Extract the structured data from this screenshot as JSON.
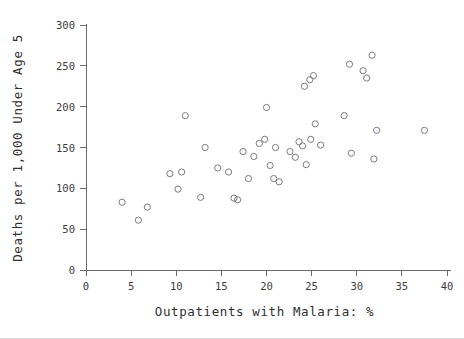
{
  "chart_data": {
    "type": "scatter",
    "title": "",
    "xlabel": "Outpatients with Malaria: %",
    "ylabel": "Deaths per 1,000 Under Age 5",
    "xlim": [
      0,
      40
    ],
    "ylim": [
      0,
      300
    ],
    "xticks": [
      0,
      5,
      10,
      15,
      20,
      25,
      30,
      35,
      40
    ],
    "yticks": [
      0,
      50,
      100,
      150,
      200,
      250,
      300
    ],
    "xtick_labels": [
      "0",
      "5",
      "10",
      "15",
      "20",
      "25",
      "30",
      "35",
      "40"
    ],
    "ytick_labels": [
      "0",
      "50",
      "100",
      "150",
      "200",
      "250",
      "300"
    ],
    "grid": false,
    "legend": false,
    "marker": "open-circle",
    "marker_color": "#7b7b88",
    "points": [
      {
        "x": 4.0,
        "y": 83
      },
      {
        "x": 5.8,
        "y": 61
      },
      {
        "x": 6.8,
        "y": 77
      },
      {
        "x": 9.3,
        "y": 118
      },
      {
        "x": 10.2,
        "y": 99
      },
      {
        "x": 10.6,
        "y": 120
      },
      {
        "x": 11.0,
        "y": 189
      },
      {
        "x": 12.7,
        "y": 89
      },
      {
        "x": 13.2,
        "y": 150
      },
      {
        "x": 14.6,
        "y": 125
      },
      {
        "x": 15.8,
        "y": 120
      },
      {
        "x": 16.4,
        "y": 88
      },
      {
        "x": 16.8,
        "y": 86
      },
      {
        "x": 17.4,
        "y": 145
      },
      {
        "x": 18.0,
        "y": 112
      },
      {
        "x": 18.6,
        "y": 139
      },
      {
        "x": 19.2,
        "y": 155
      },
      {
        "x": 19.8,
        "y": 160
      },
      {
        "x": 20.0,
        "y": 199
      },
      {
        "x": 20.4,
        "y": 128
      },
      {
        "x": 20.8,
        "y": 112
      },
      {
        "x": 21.0,
        "y": 150
      },
      {
        "x": 21.4,
        "y": 108
      },
      {
        "x": 22.6,
        "y": 145
      },
      {
        "x": 23.2,
        "y": 138
      },
      {
        "x": 23.6,
        "y": 157
      },
      {
        "x": 24.0,
        "y": 152
      },
      {
        "x": 24.2,
        "y": 225
      },
      {
        "x": 24.4,
        "y": 129
      },
      {
        "x": 24.8,
        "y": 233
      },
      {
        "x": 24.9,
        "y": 160
      },
      {
        "x": 25.2,
        "y": 238
      },
      {
        "x": 25.4,
        "y": 179
      },
      {
        "x": 26.0,
        "y": 153
      },
      {
        "x": 28.6,
        "y": 189
      },
      {
        "x": 29.2,
        "y": 252
      },
      {
        "x": 29.4,
        "y": 143
      },
      {
        "x": 30.7,
        "y": 244
      },
      {
        "x": 31.1,
        "y": 235
      },
      {
        "x": 31.7,
        "y": 263
      },
      {
        "x": 31.9,
        "y": 136
      },
      {
        "x": 32.2,
        "y": 171
      },
      {
        "x": 37.5,
        "y": 171
      }
    ]
  }
}
